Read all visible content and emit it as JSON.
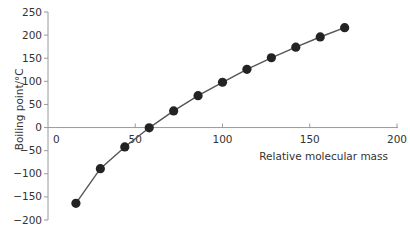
{
  "chart_data": {
    "type": "line",
    "title": "",
    "xlabel": "Relative molecular mass",
    "ylabel": "Boiling point/°C",
    "xlim": [
      0,
      200
    ],
    "ylim": [
      -200,
      250
    ],
    "x_ticks": [
      0,
      50,
      100,
      150,
      200
    ],
    "y_ticks": [
      -200,
      -150,
      -100,
      -50,
      0,
      50,
      100,
      150,
      200,
      250
    ],
    "x_tick_labels": [
      "0",
      "50",
      "100",
      "150",
      "200"
    ],
    "y_tick_labels": [
      "-200",
      "-150",
      "-100",
      "-50",
      "0",
      "50",
      "100",
      "150",
      "200",
      "250"
    ],
    "grid": false,
    "legend": null,
    "markers": true,
    "series": [
      {
        "name": "Boiling point",
        "x": [
          16,
          30,
          44,
          58,
          72,
          86,
          100,
          114,
          128,
          142,
          156,
          170
        ],
        "y": [
          -164,
          -89,
          -42,
          -0.5,
          36,
          69,
          98,
          126,
          151,
          174,
          196,
          216
        ]
      }
    ]
  }
}
